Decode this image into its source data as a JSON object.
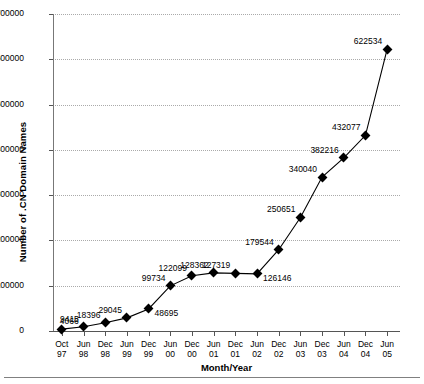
{
  "chart_data": {
    "type": "line",
    "title": "",
    "xlabel": "Month/Year",
    "ylabel": "Number of .CN Domain Names",
    "categories": [
      "Oct 97",
      "Jun 98",
      "Dec 98",
      "Jun 99",
      "Dec 99",
      "Jun 00",
      "Dec 00",
      "Jun 01",
      "Dec 01",
      "Jun 02",
      "Dec 02",
      "Jun 03",
      "Dec 03",
      "Jun 04",
      "Dec 04",
      "Jun 05"
    ],
    "xtick_labels": [
      {
        "month": "Oct",
        "year": "97"
      },
      {
        "month": "Jun",
        "year": "98"
      },
      {
        "month": "Dec",
        "year": "98"
      },
      {
        "month": "Jun",
        "year": "99"
      },
      {
        "month": "Dec",
        "year": "99"
      },
      {
        "month": "Jun",
        "year": "00"
      },
      {
        "month": "Dec",
        "year": "00"
      },
      {
        "month": "Jun",
        "year": "01"
      },
      {
        "month": "Dec",
        "year": "01"
      },
      {
        "month": "Jun",
        "year": "02"
      },
      {
        "month": "Dec",
        "year": "02"
      },
      {
        "month": "Jun",
        "year": "03"
      },
      {
        "month": "Dec",
        "year": "03"
      },
      {
        "month": "Jun",
        "year": "04"
      },
      {
        "month": "Dec",
        "year": "04"
      },
      {
        "month": "Jun",
        "year": "05"
      }
    ],
    "values": [
      4066,
      9415,
      18396,
      29045,
      48695,
      99734,
      122099,
      128362,
      127319,
      126146,
      179544,
      250651,
      340040,
      382216,
      432077,
      622534
    ],
    "point_labels": [
      "4066",
      "9415",
      "18396",
      "29045",
      "48695",
      "99734",
      "122099",
      "128362",
      "127319",
      "126146",
      "179544",
      "250651",
      "340040",
      "382216",
      "432077",
      "622534"
    ],
    "ylim": [
      0,
      700000
    ],
    "yticks": [
      0,
      100000,
      200000,
      300000,
      400000,
      500000,
      600000,
      700000
    ],
    "ytick_labels": [
      "0",
      "100000",
      "200000",
      "300000",
      "400000",
      "500000",
      "600000",
      "700000"
    ],
    "grid": true,
    "legend": false,
    "marker": "diamond",
    "line_color": "#000000",
    "grid_color": "#aaaaaa"
  }
}
